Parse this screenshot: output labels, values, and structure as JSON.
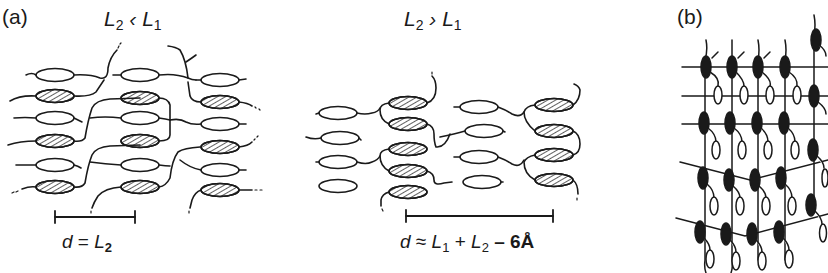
{
  "figure": {
    "panel_a_label": "(a)",
    "panel_b_label": "(b)",
    "left_condition": {
      "L": "L",
      "sub2": "2",
      "op": " ‹ ",
      "sub1": "1"
    },
    "mid_condition": {
      "L": "L",
      "sub2": "2",
      "op": " › ",
      "sub1": "1"
    },
    "left_formula": {
      "d": "d",
      "eq": " = ",
      "L": "L",
      "sub": "2"
    },
    "mid_formula": {
      "d": "d",
      "eq": " ≈ ",
      "L1": "L",
      "s1": "1",
      "plus": " + ",
      "L2": "L",
      "s2": "2",
      "rest": " – 6Å"
    }
  },
  "legend_semantics": {
    "hatched_ellipse": "mesogenic core (type 2)",
    "open_ellipse": "mesogenic core (type 1)",
    "filled_ellipse": "dark core",
    "scale_bar": "layer spacing d"
  },
  "colors": {
    "ink": "#1a1a1a",
    "background": "#ffffff"
  },
  "panel_a_left": {
    "open": [
      [
        60,
        78
      ],
      [
        160,
        78
      ],
      [
        225,
        80
      ],
      [
        60,
        118
      ],
      [
        160,
        118
      ],
      [
        222,
        124
      ],
      [
        60,
        163
      ],
      [
        160,
        165
      ],
      [
        225,
        168
      ]
    ],
    "hatched": [
      [
        60,
        96
      ],
      [
        159,
        95
      ],
      [
        225,
        98
      ],
      [
        60,
        141
      ],
      [
        160,
        141
      ],
      [
        225,
        148
      ],
      [
        60,
        186
      ],
      [
        160,
        187
      ],
      [
        225,
        188
      ]
    ],
    "scale_bar": {
      "x1": 55,
      "x2": 135,
      "y": 217
    }
  },
  "panel_a_mid": {
    "open": [
      [
        340,
        97
      ],
      [
        338,
        140
      ],
      [
        340,
        160
      ],
      [
        340,
        186
      ],
      [
        478,
        108
      ],
      [
        483,
        131
      ],
      [
        480,
        157
      ],
      [
        482,
        183
      ]
    ],
    "hatched": [
      [
        410,
        100
      ],
      [
        410,
        124
      ],
      [
        410,
        148
      ],
      [
        410,
        171
      ],
      [
        410,
        191
      ],
      [
        556,
        106
      ],
      [
        556,
        132
      ],
      [
        556,
        156
      ],
      [
        556,
        179
      ]
    ],
    "scale_bar": {
      "x1": 406,
      "x2": 553,
      "y": 216
    }
  },
  "panel_b": {
    "columns_x": [
      705,
      731,
      758,
      785,
      815
    ],
    "row_lines_y": [
      67,
      96,
      124
    ],
    "tilted_lines": [
      {
        "x1": 680,
        "y1": 162,
        "x2": 828,
        "y2": 150
      },
      {
        "x1": 676,
        "y1": 218,
        "x2": 828,
        "y2": 208
      }
    ]
  }
}
